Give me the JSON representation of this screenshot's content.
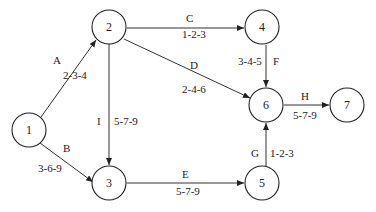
{
  "diagram": {
    "type": "activity-on-arrow network",
    "nodes": [
      {
        "id": "1",
        "label": "1",
        "x": 29,
        "y": 130
      },
      {
        "id": "2",
        "label": "2",
        "x": 109,
        "y": 27
      },
      {
        "id": "3",
        "label": "3",
        "x": 109,
        "y": 183
      },
      {
        "id": "4",
        "label": "4",
        "x": 262,
        "y": 27
      },
      {
        "id": "5",
        "label": "5",
        "x": 262,
        "y": 183
      },
      {
        "id": "6",
        "label": "6",
        "x": 266,
        "y": 105
      },
      {
        "id": "7",
        "label": "7",
        "x": 347,
        "y": 105
      }
    ],
    "edges": [
      {
        "activity": "A",
        "from": "1",
        "to": "2",
        "estimate": "2-3-4"
      },
      {
        "activity": "B",
        "from": "1",
        "to": "3",
        "estimate": "3-6-9"
      },
      {
        "activity": "C",
        "from": "2",
        "to": "4",
        "estimate": "1-2-3"
      },
      {
        "activity": "D",
        "from": "2",
        "to": "6",
        "estimate": "2-4-6"
      },
      {
        "activity": "I",
        "from": "2",
        "to": "3",
        "estimate": "5-7-9"
      },
      {
        "activity": "E",
        "from": "3",
        "to": "5",
        "estimate": "5-7-9"
      },
      {
        "activity": "F",
        "from": "4",
        "to": "6",
        "estimate": "3-4-5"
      },
      {
        "activity": "G",
        "from": "5",
        "to": "6",
        "estimate": "1-2-3"
      },
      {
        "activity": "H",
        "from": "6",
        "to": "7",
        "estimate": "5-7-9"
      }
    ]
  }
}
